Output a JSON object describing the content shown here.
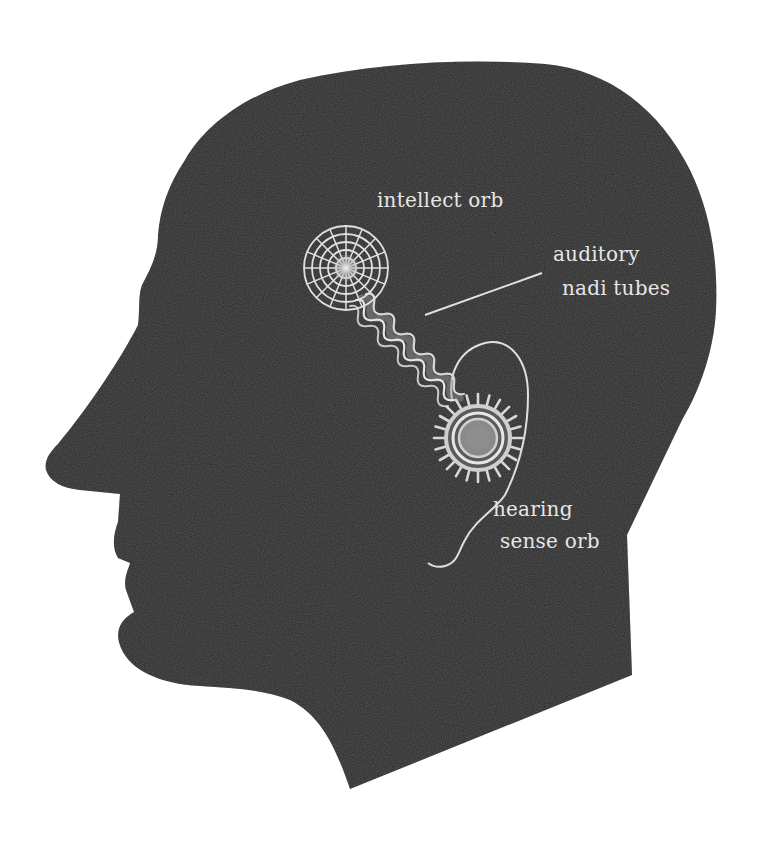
{
  "diagram": {
    "colors": {
      "background": "#ffffff",
      "silhouette": "#232323",
      "line_art": "#e0e0e0",
      "orb_core": "#8a8a8a",
      "label_text": "#e6e6e6"
    },
    "labels": {
      "intellect_orb": "intellect orb",
      "auditory_line1": "auditory",
      "auditory_line2": "nadi tubes",
      "hearing_line1": "hearing",
      "hearing_line2": "sense orb"
    },
    "elements": [
      {
        "id": "intellect-orb",
        "shape": "web-circle",
        "rings": 5,
        "spokes": 16
      },
      {
        "id": "auditory-nadi-tubes",
        "shape": "wavy-tubes",
        "count": 3,
        "connects": [
          "intellect-orb",
          "hearing-sense-orb"
        ]
      },
      {
        "id": "hearing-sense-orb",
        "shape": "spiked-concentric-circle"
      },
      {
        "id": "ear-outline",
        "shape": "outline"
      }
    ]
  }
}
